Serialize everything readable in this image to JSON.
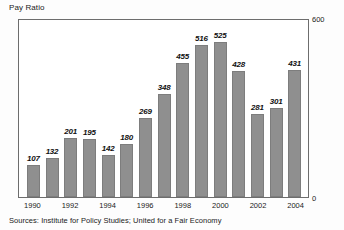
{
  "chart_data": {
    "type": "bar",
    "title": "Pay Ratio",
    "xlabel": "",
    "ylabel": "",
    "ylim": [
      0,
      600
    ],
    "grid": false,
    "legend": null,
    "y_axis_position": "right",
    "y_ticks": [
      "0",
      "600"
    ],
    "y_tick_max": "600",
    "y_tick_min": "0",
    "categories": [
      "1990",
      "1991",
      "1992",
      "1993",
      "1994",
      "1995",
      "1996",
      "1997",
      "1998",
      "1999",
      "2000",
      "2001",
      "2002",
      "2003",
      "2004"
    ],
    "values": [
      107,
      132,
      201,
      195,
      142,
      180,
      269,
      348,
      455,
      516,
      525,
      428,
      281,
      301,
      431
    ],
    "x_tick_labels": [
      "1990",
      "1992",
      "1994",
      "1996",
      "1998",
      "2000",
      "2002",
      "2004"
    ],
    "bar_color": "#8f8f8f",
    "bar_edge_color": "#7d7d7d",
    "frame_color": "#6d6d6d",
    "note": "Sources:  Institute for Policy Studies; United for a Fair Economy"
  },
  "footer": {
    "sources": "Sources:  Institute for Policy Studies; United for a Fair Economy"
  }
}
